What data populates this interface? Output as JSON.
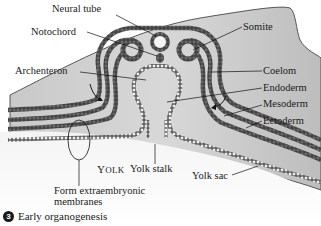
{
  "figure": {
    "step_number": "3",
    "caption": "Early organogenesis"
  },
  "labels": {
    "neural_tube": "Neural tube",
    "notochord": "Notochord",
    "somite": "Somite",
    "archenteron": "Archenteron",
    "coelom": "Coelom",
    "endoderm": "Endoderm",
    "mesoderm": "Mesoderm",
    "ectoderm": "Ectoderm",
    "yolk_cap": "Y",
    "yolk_rest": "OLK",
    "yolk_stalk": "Yolk stalk",
    "yolk_sac": "Yolk sac",
    "extraembryonic_line1": "Form extraembryonic",
    "extraembryonic_line2": "membranes"
  },
  "colors": {
    "embryo_fill": "#c8c8c8",
    "germ_layer_cells": "#4a4a4a",
    "endoderm_cells": "#e8e8e8",
    "text": "#1a1a1a"
  }
}
